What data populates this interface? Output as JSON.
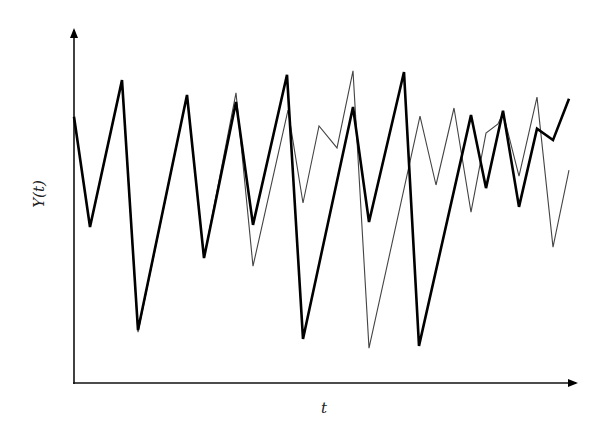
{
  "chart_data": {
    "type": "line",
    "title": "",
    "xlabel": "t",
    "ylabel": "Y(t)",
    "grid": false,
    "legend": null,
    "ticks": {
      "x": [],
      "y": []
    },
    "axis_style": "arrowed axes, no tick marks",
    "ylim_note": "values on relative 0-100 scale (axis origin = 0, arrow tip = 100)",
    "series": [
      {
        "name": "thick-series",
        "stroke": "#000000",
        "stroke_width": 2.6,
        "t_px": [
          74,
          90,
          122,
          138,
          187,
          204,
          236,
          253,
          287,
          303,
          353,
          369,
          404,
          419,
          471,
          486,
          503,
          519,
          537,
          553,
          569
        ],
        "values": [
          75.4,
          44.2,
          85.8,
          15.0,
          81.6,
          35.4,
          79.6,
          44.8,
          87.3,
          12.5,
          78.2,
          45.6,
          88.1,
          10.5,
          75.9,
          55.2,
          77.1,
          49.9,
          72.0,
          68.8,
          80.5
        ]
      },
      {
        "name": "thin-series",
        "stroke": "#444444",
        "stroke_width": 1.1,
        "t_px": [
          74,
          90,
          122,
          138,
          187,
          204,
          236,
          253,
          288,
          303,
          319,
          337,
          353,
          369,
          420,
          436,
          454,
          471,
          486,
          498,
          503,
          519,
          537,
          553,
          569
        ],
        "values": [
          75.4,
          44.2,
          85.8,
          14.4,
          81.6,
          35.4,
          82.2,
          33.1,
          77.3,
          51.0,
          72.8,
          66.6,
          88.4,
          9.9,
          75.6,
          56.1,
          77.9,
          48.4,
          70.8,
          73.4,
          76.5,
          58.6,
          81.0,
          38.5,
          60.3
        ]
      }
    ]
  },
  "labels": {
    "x_axis": "t",
    "y_axis": "Y(t)"
  },
  "layout": {
    "origin_x": 74,
    "origin_y": 383,
    "y_top": 30,
    "x_right": 576
  }
}
